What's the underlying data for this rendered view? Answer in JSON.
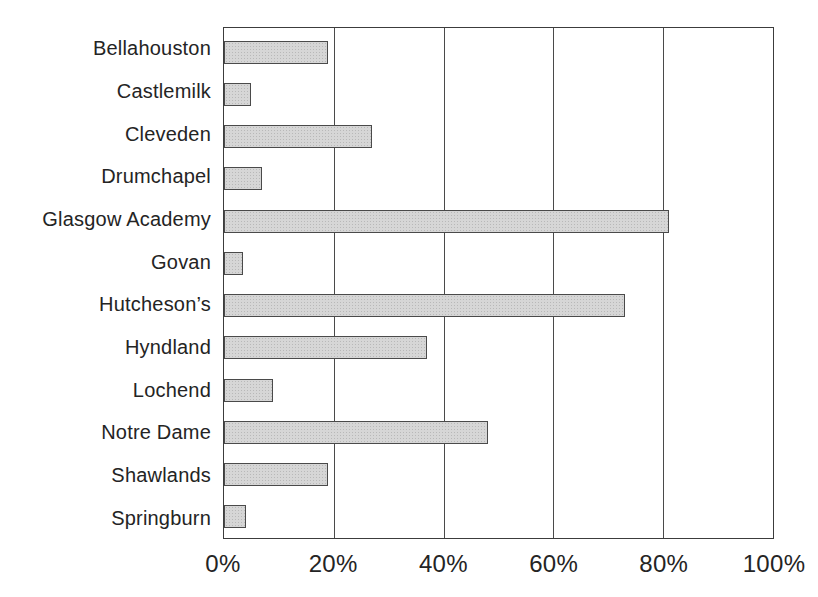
{
  "figure": {
    "title": "",
    "background": "#ffffff"
  },
  "colors": {
    "bar_fill": "#d6d6d6",
    "bar_border": "#4a4a4a",
    "frame_border": "#3c3c3c",
    "gridline": "#4a4a4a",
    "text": "#242424",
    "background": "#ffffff"
  },
  "chart_data": {
    "type": "bar",
    "orientation": "horizontal",
    "title": "",
    "xlabel": "",
    "ylabel": "",
    "categories": [
      "Bellahouston",
      "Castlemilk",
      "Cleveden",
      "Drumchapel",
      "Glasgow Academy",
      "Govan",
      "Hutcheson’s",
      "Hyndland",
      "Lochend",
      "Notre Dame",
      "Shawlands",
      "Springburn"
    ],
    "values": [
      19,
      5,
      27,
      7,
      81,
      3.5,
      73,
      37,
      9,
      48,
      19,
      4
    ],
    "value_unit": "%",
    "xlim": [
      0,
      100
    ],
    "x_ticks": [
      {
        "value": 0,
        "label": "0%"
      },
      {
        "value": 20,
        "label": "20%"
      },
      {
        "value": 40,
        "label": "40%"
      },
      {
        "value": 60,
        "label": "60%"
      },
      {
        "value": 80,
        "label": "80%"
      },
      {
        "value": 100,
        "label": "100%"
      }
    ],
    "grid": "vertical gridlines at x ticks",
    "legend": "none"
  }
}
